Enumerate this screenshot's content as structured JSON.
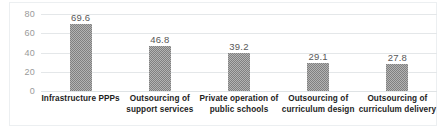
{
  "chart_data": {
    "type": "bar",
    "title": "",
    "xlabel": "",
    "ylabel": "",
    "categories": [
      "Infrastructure PPPs",
      "Outsourcing of support services",
      "Private operation of public schools",
      "Outsourcing of curriculum design",
      "Outsourcing of curriculum delivery"
    ],
    "category_lines": [
      [
        "Infrastructure PPPs",
        ""
      ],
      [
        "Outsourcing of",
        "support services"
      ],
      [
        "Private operation of",
        "public schools"
      ],
      [
        "Outsourcing of",
        "curriculum design"
      ],
      [
        "Outsourcing of",
        "curriculum delivery"
      ]
    ],
    "values": [
      69.6,
      46.8,
      39.2,
      29.1,
      27.8
    ],
    "value_labels": [
      "69.6",
      "46.8",
      "39.2",
      "29.1",
      "27.8"
    ],
    "ylim": [
      0,
      80
    ],
    "yticks": [
      0,
      20,
      40,
      60,
      80
    ],
    "ytick_labels": [
      "0",
      "20",
      "40",
      "60",
      "80"
    ],
    "grid": true,
    "legend": "none",
    "bar_color": "#808080",
    "gridline_color": "#e4e7e9",
    "axis_text_color": "#9a9a9a",
    "label_text_color": "#1d1d1d",
    "border_color": "#eceff1"
  }
}
